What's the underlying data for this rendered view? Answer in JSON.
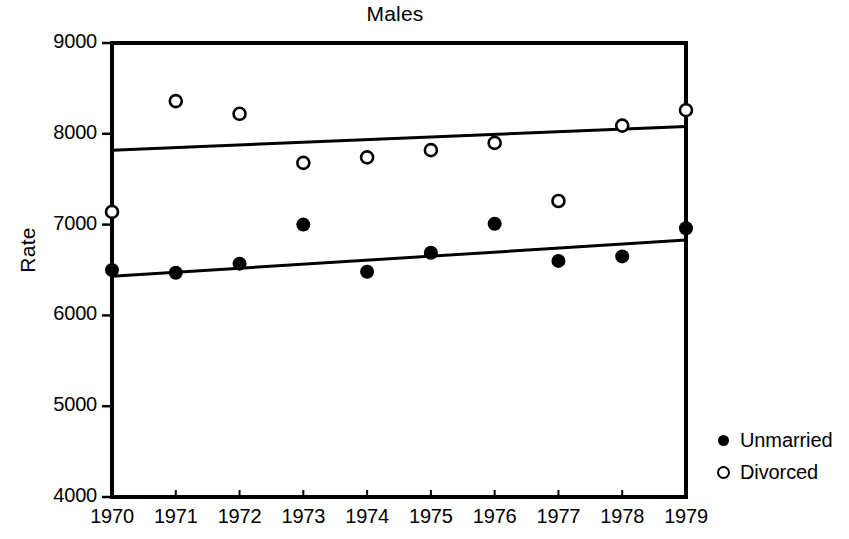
{
  "chart_data": {
    "type": "scatter",
    "title": "Males",
    "xlabel": "",
    "ylabel": "Rate",
    "x": [
      1970,
      1971,
      1972,
      1973,
      1974,
      1975,
      1976,
      1977,
      1978,
      1979
    ],
    "categories": [
      "1970",
      "1971",
      "1972",
      "1973",
      "1974",
      "1975",
      "1976",
      "1977",
      "1978",
      "1979"
    ],
    "xlim": [
      1970,
      1979
    ],
    "ylim": [
      4000,
      9000
    ],
    "y_ticks": [
      4000,
      5000,
      6000,
      7000,
      8000,
      9000
    ],
    "y_tick_labels": [
      "4000",
      "5000",
      "6000",
      "7000",
      "8000",
      "9000"
    ],
    "x_ticks": [
      1970,
      1971,
      1972,
      1973,
      1974,
      1975,
      1976,
      1977,
      1978,
      1979
    ],
    "x_tick_labels": [
      "1970",
      "1971",
      "1972",
      "1973",
      "1974",
      "1975",
      "1976",
      "1977",
      "1978",
      "1979"
    ],
    "grid": false,
    "legend_position": "right",
    "series": [
      {
        "name": "Unmarried",
        "marker": "filled-circle",
        "color": "#000000",
        "values": [
          6500,
          6470,
          6570,
          7000,
          6480,
          6690,
          7010,
          6600,
          6650,
          6960
        ],
        "trend_line": {
          "x": [
            1970,
            1979
          ],
          "y": [
            6430,
            6830
          ]
        }
      },
      {
        "name": "Divorced",
        "marker": "open-circle",
        "color": "#000000",
        "values": [
          7140,
          8360,
          8220,
          7680,
          7740,
          7820,
          7900,
          7260,
          8090,
          8260
        ],
        "trend_line": {
          "x": [
            1970,
            1979
          ],
          "y": [
            7820,
            8080
          ]
        }
      }
    ]
  },
  "legend": {
    "items": [
      {
        "label": "Unmarried",
        "marker": "filled-circle"
      },
      {
        "label": "Divorced",
        "marker": "open-circle"
      }
    ]
  }
}
